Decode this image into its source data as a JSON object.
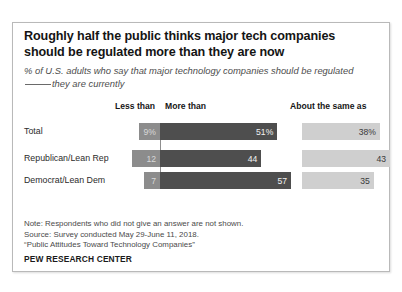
{
  "card": {
    "title": "Roughly half the public thinks major tech companies should be regulated more than they are now",
    "subtitle_part1": "% of U.S. adults who say that major technology companies should be regulated",
    "subtitle_part2": "they are currently",
    "notes": [
      "Note: Respondents who did not give an answer are not shown.",
      "Source: Survey conducted May 29-June 11, 2018.",
      "“Public Attitudes Toward Technology Companies”"
    ],
    "brand": "PEW RESEARCH CENTER"
  },
  "chart_data": {
    "type": "bar",
    "title": "Roughly half the public thinks major tech companies should be regulated more than they are now",
    "subtitle": "% of U.S. adults who say that major technology companies should be regulated ____ they are currently",
    "xlabel": "",
    "ylabel": "",
    "orientation": "horizontal",
    "stacked": true,
    "grid": false,
    "legend_position": "top",
    "categories": [
      "Total",
      "Republican/Lean Rep",
      "Democrat/Lean Dem"
    ],
    "series": [
      {
        "name": "Less than",
        "color": "#8c8c8c",
        "values": [
          9,
          12,
          7
        ],
        "labels": [
          "9%",
          "12",
          "7"
        ]
      },
      {
        "name": "More than",
        "color": "#4e4e4e",
        "values": [
          51,
          44,
          57
        ],
        "labels": [
          "51%",
          "44",
          "57"
        ]
      },
      {
        "name": "About the same as",
        "color": "#cfcfcf",
        "values": [
          38,
          43,
          35
        ],
        "labels": [
          "38%",
          "43",
          "35"
        ]
      }
    ],
    "headers": {
      "less": "Less than",
      "more": "More than",
      "same": "About the same as"
    },
    "notes": "Respondents who did not give an answer are not shown.",
    "source": "Survey conducted May 29-June 11, 2018. “Public Attitudes Toward Technology Companies”"
  }
}
